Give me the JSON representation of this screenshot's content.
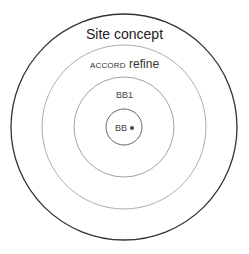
{
  "diagram": {
    "type": "concentric-circles",
    "center": [
      124,
      127
    ],
    "rings": [
      {
        "label": "Site concept",
        "radius": 113,
        "stroke": "#333333",
        "stroke_width": 1.3
      },
      {
        "label_smallcaps": "ACCORD",
        "label_rest": "refine",
        "radius": 82,
        "stroke": "#888888",
        "stroke_width": 0.8
      },
      {
        "label": "BB1",
        "radius": 50,
        "stroke": "#777777",
        "stroke_width": 0.8
      },
      {
        "label": "BB",
        "marker": "•",
        "radius": 18,
        "stroke": "#555555",
        "stroke_width": 0.9
      }
    ]
  }
}
